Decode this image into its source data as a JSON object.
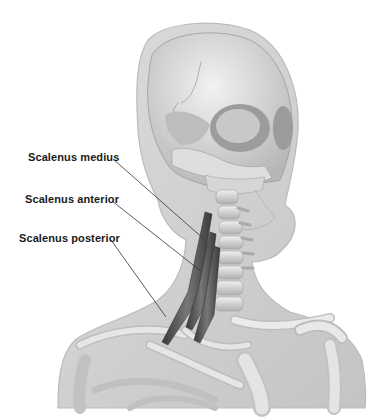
{
  "figure": {
    "colors": {
      "skin": "#d4d4d4",
      "skin_edge": "#bdbdbd",
      "bone": "#e8e8e8",
      "bone_shadow": "#a8a8a8",
      "muscle": "#555555",
      "leader": "#333333",
      "text": "#1a1a1a"
    }
  },
  "labels": [
    {
      "id": "scalenus-medius",
      "text": "Scalenus medius",
      "x": 28,
      "y": 148,
      "line": [
        [
          113,
          159
        ],
        [
          205,
          240
        ]
      ]
    },
    {
      "id": "scalenus-anterior",
      "text": "Scalenus anterior",
      "x": 25,
      "y": 190,
      "line": [
        [
          112,
          201
        ],
        [
          202,
          272
        ]
      ]
    },
    {
      "id": "scalenus-posterior",
      "text": "Scalenus posterior",
      "x": 19,
      "y": 229,
      "line": [
        [
          111,
          240
        ],
        [
          166,
          317
        ]
      ]
    }
  ]
}
